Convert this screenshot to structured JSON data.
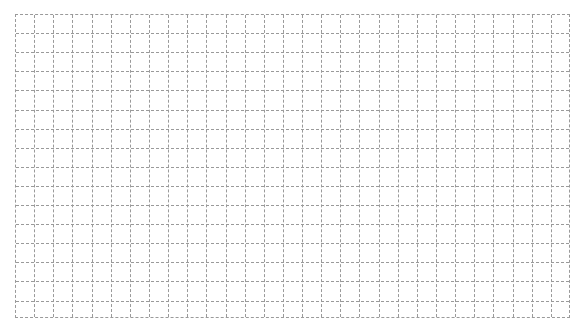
{
  "document": {
    "type": "grid-paper",
    "grid": {
      "columns": 29,
      "rows": 16,
      "cell_size_px": 19.1,
      "line_style": "dashed",
      "line_color": "#9a9a9a",
      "background_color": "#ffffff"
    },
    "text_content": []
  }
}
